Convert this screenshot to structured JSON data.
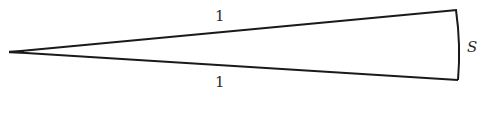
{
  "diagram": {
    "type": "sector / thin wedge",
    "labels": {
      "top_side": "1",
      "bottom_side": "1",
      "arc": "S"
    },
    "colors": {
      "stroke": "#1a1a1a",
      "text": "#2a2a2a",
      "background": "#ffffff"
    }
  }
}
